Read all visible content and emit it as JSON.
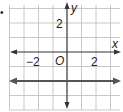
{
  "bullet": "•",
  "graph": {
    "x_axis_label": "x",
    "y_axis_label": "y",
    "origin_label": "O",
    "x_tick_labels": [
      "−2",
      "2"
    ],
    "y_tick_labels": [
      "2"
    ],
    "line": {
      "equation": "y = -2",
      "color": "#555555"
    },
    "grid_color": "#c8c8c8",
    "axis_color": "#333333"
  }
}
